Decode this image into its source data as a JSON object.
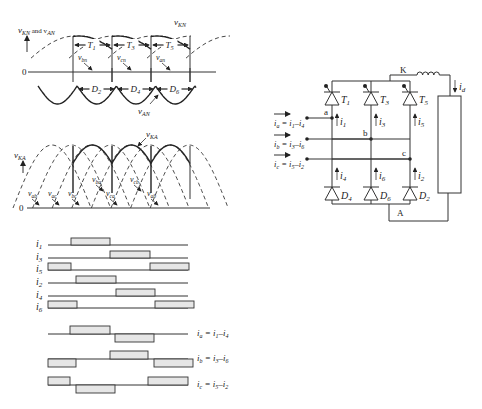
{
  "top_plot": {
    "y_label": "v",
    "y_label_sub": "KN",
    "y_label_and": " and v",
    "y_label_sub2": "AN",
    "zero_label": "0",
    "curve_label_top": "v",
    "curve_label_top_sub": "KN",
    "curve_label_bottom": "v",
    "curve_label_bottom_sub": "AN",
    "thyristor_intervals": [
      {
        "label": "T",
        "sub": "1",
        "x1": 73,
        "x2": 112
      },
      {
        "label": "T",
        "sub": "3",
        "x1": 112,
        "x2": 151
      },
      {
        "label": "T",
        "sub": "5",
        "x1": 151,
        "x2": 190
      }
    ],
    "diode_intervals": [
      {
        "label": "D",
        "sub": "2",
        "x1": 77,
        "x2": 116
      },
      {
        "label": "D",
        "sub": "4",
        "x1": 116,
        "x2": 155
      },
      {
        "label": "D",
        "sub": "6",
        "x1": 155,
        "x2": 194
      }
    ],
    "phase_labels": [
      {
        "text": "v",
        "sub": "bn",
        "x": 78,
        "y": 60
      },
      {
        "text": "v",
        "sub": "cn",
        "x": 117,
        "y": 60
      },
      {
        "text": "v",
        "sub": "an",
        "x": 156,
        "y": 60
      }
    ]
  },
  "bottom_plot": {
    "y_label": "v",
    "y_label_sub": "KA",
    "zero_label": "0",
    "curve_label": "v",
    "curve_label_sub": "KA",
    "phase_labels": [
      {
        "text": "v",
        "sub": "ab",
        "x": 28,
        "y": 196
      },
      {
        "text": "v",
        "sub": "ac",
        "x": 48,
        "y": 196
      },
      {
        "text": "v",
        "sub": "bc",
        "x": 68,
        "y": 196
      },
      {
        "text": "v",
        "sub": "ba",
        "x": 92,
        "y": 182
      },
      {
        "text": "v",
        "sub": "ca",
        "x": 106,
        "y": 196
      },
      {
        "text": "v",
        "sub": "cb",
        "x": 130,
        "y": 182
      },
      {
        "text": "v",
        "sub": "ab",
        "x": 147,
        "y": 196
      }
    ]
  },
  "pulse_diagram": {
    "x_start": 48,
    "x_end": 188,
    "rows": [
      {
        "label": "i",
        "sub": "1",
        "y": 245,
        "pulses": [
          [
            71,
            110
          ]
        ]
      },
      {
        "label": "i",
        "sub": "3",
        "y": 258,
        "pulses": [
          [
            110,
            150
          ]
        ]
      },
      {
        "label": "i",
        "sub": "5",
        "y": 270,
        "pulses": [
          [
            48,
            71
          ],
          [
            150,
            189
          ]
        ]
      },
      {
        "label": "i",
        "sub": "2",
        "y": 283,
        "pulses": [
          [
            76,
            116
          ]
        ]
      },
      {
        "label": "i",
        "sub": "4",
        "y": 296,
        "pulses": [
          [
            116,
            155
          ]
        ]
      },
      {
        "label": "i",
        "sub": "6",
        "y": 308,
        "pulses": [
          [
            48,
            77
          ],
          [
            155,
            194
          ]
        ]
      }
    ]
  },
  "line_currents": {
    "rows": [
      {
        "label": "i",
        "sub": "a",
        "eq": " = i",
        "eq_sub1": "1",
        "dash": "–i",
        "eq_sub2": "4",
        "y": 334,
        "pos": [
          [
            70,
            110
          ]
        ],
        "neg": [
          [
            115,
            154
          ]
        ]
      },
      {
        "label": "i",
        "sub": "b",
        "eq": " = i",
        "eq_sub1": "3",
        "dash": "–i",
        "eq_sub2": "6",
        "y": 359,
        "pos": [
          [
            110,
            148
          ]
        ],
        "neg": [
          [
            48,
            76
          ],
          [
            154,
            193
          ]
        ]
      },
      {
        "label": "i",
        "sub": "c",
        "eq": " = i",
        "eq_sub1": "5",
        "dash": "–i",
        "eq_sub2": "2",
        "y": 385,
        "pos": [
          [
            48,
            70
          ],
          [
            148,
            188
          ]
        ],
        "neg": [
          [
            76,
            115
          ]
        ]
      }
    ]
  },
  "circuit": {
    "thyristors": [
      {
        "label": "T",
        "sub": "1",
        "x": 332,
        "current": "i",
        "current_sub": "1"
      },
      {
        "label": "T",
        "sub": "3",
        "x": 371,
        "current": "i",
        "current_sub": "3"
      },
      {
        "label": "T",
        "sub": "5",
        "x": 410,
        "current": "i",
        "current_sub": "5"
      }
    ],
    "diodes": [
      {
        "label": "D",
        "sub": "4",
        "x": 332,
        "current": "i",
        "current_sub": "4"
      },
      {
        "label": "D",
        "sub": "6",
        "x": 371,
        "current": "i",
        "current_sub": "6"
      },
      {
        "label": "D",
        "sub": "2",
        "x": 410,
        "current": "i",
        "current_sub": "2"
      }
    ],
    "nodes": [
      {
        "label": "a",
        "y": 118,
        "col": 332
      },
      {
        "label": "b",
        "y": 139,
        "col": 371
      },
      {
        "label": "c",
        "y": 159,
        "col": 410
      }
    ],
    "inputs": [
      {
        "label": "i",
        "sub": "a",
        "eq": " = i",
        "s1": "1",
        "d": "–i",
        "s2": "4"
      },
      {
        "label": "i",
        "sub": "b",
        "eq": " = i",
        "s1": "3",
        "d": "–i",
        "s2": "6"
      },
      {
        "label": "i",
        "sub": "c",
        "eq": " = i",
        "s1": "5",
        "d": "–i",
        "s2": "2"
      }
    ],
    "cathode_label": "K",
    "anode_label": "A",
    "load_current": "i",
    "load_current_sub": "d"
  }
}
